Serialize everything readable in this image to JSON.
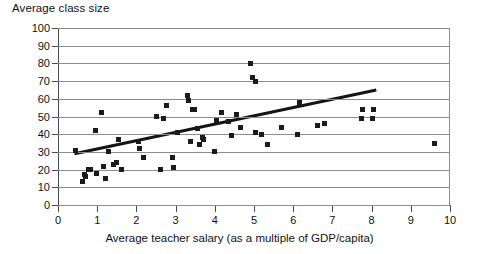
{
  "chart_data": {
    "type": "scatter",
    "title": "Average class size",
    "xlabel": "Average teacher salary (as a multiple of GDP/capita)",
    "ylabel": "Average class size",
    "xlim": [
      0,
      10
    ],
    "ylim": [
      0,
      100
    ],
    "xticks": [
      0,
      1,
      2,
      3,
      4,
      5,
      6,
      7,
      8,
      9,
      10
    ],
    "yticks": [
      0,
      10,
      20,
      30,
      40,
      50,
      60,
      70,
      80,
      90,
      100
    ],
    "grid": "horizontal",
    "legend": null,
    "marker": {
      "shape": "square",
      "color": "#1b1b1b",
      "size_px": 5
    },
    "points": [
      {
        "x": 0.45,
        "y": 31
      },
      {
        "x": 0.62,
        "y": 13
      },
      {
        "x": 0.68,
        "y": 17
      },
      {
        "x": 0.7,
        "y": 16
      },
      {
        "x": 0.78,
        "y": 20
      },
      {
        "x": 0.82,
        "y": 20
      },
      {
        "x": 0.95,
        "y": 42
      },
      {
        "x": 0.98,
        "y": 18
      },
      {
        "x": 1.12,
        "y": 52
      },
      {
        "x": 1.15,
        "y": 22
      },
      {
        "x": 1.22,
        "y": 15
      },
      {
        "x": 1.3,
        "y": 30
      },
      {
        "x": 1.42,
        "y": 23
      },
      {
        "x": 1.48,
        "y": 24
      },
      {
        "x": 1.55,
        "y": 37
      },
      {
        "x": 1.62,
        "y": 20
      },
      {
        "x": 2.05,
        "y": 36
      },
      {
        "x": 2.08,
        "y": 32
      },
      {
        "x": 2.18,
        "y": 27
      },
      {
        "x": 2.52,
        "y": 50
      },
      {
        "x": 2.62,
        "y": 20
      },
      {
        "x": 2.7,
        "y": 49
      },
      {
        "x": 2.78,
        "y": 56
      },
      {
        "x": 2.92,
        "y": 27
      },
      {
        "x": 2.95,
        "y": 21
      },
      {
        "x": 3.05,
        "y": 41
      },
      {
        "x": 3.3,
        "y": 62
      },
      {
        "x": 3.32,
        "y": 59
      },
      {
        "x": 3.38,
        "y": 36
      },
      {
        "x": 3.42,
        "y": 54
      },
      {
        "x": 3.48,
        "y": 54
      },
      {
        "x": 3.55,
        "y": 43
      },
      {
        "x": 3.62,
        "y": 34
      },
      {
        "x": 3.68,
        "y": 38
      },
      {
        "x": 3.72,
        "y": 37
      },
      {
        "x": 4.0,
        "y": 30
      },
      {
        "x": 4.05,
        "y": 48
      },
      {
        "x": 4.18,
        "y": 52
      },
      {
        "x": 4.35,
        "y": 47
      },
      {
        "x": 4.42,
        "y": 39
      },
      {
        "x": 4.55,
        "y": 51
      },
      {
        "x": 4.65,
        "y": 44
      },
      {
        "x": 4.92,
        "y": 80
      },
      {
        "x": 4.95,
        "y": 72
      },
      {
        "x": 5.05,
        "y": 70
      },
      {
        "x": 5.05,
        "y": 41
      },
      {
        "x": 5.18,
        "y": 40
      },
      {
        "x": 5.35,
        "y": 34
      },
      {
        "x": 5.7,
        "y": 44
      },
      {
        "x": 6.1,
        "y": 40
      },
      {
        "x": 6.15,
        "y": 58
      },
      {
        "x": 6.62,
        "y": 45
      },
      {
        "x": 6.8,
        "y": 46
      },
      {
        "x": 7.75,
        "y": 49
      },
      {
        "x": 7.78,
        "y": 54
      },
      {
        "x": 8.02,
        "y": 49
      },
      {
        "x": 8.05,
        "y": 54
      },
      {
        "x": 9.6,
        "y": 35
      }
    ],
    "trendline": {
      "x1": 0.42,
      "y1": 29,
      "x2": 8.12,
      "y2": 65,
      "color": "#141414",
      "width_px": 3
    }
  }
}
